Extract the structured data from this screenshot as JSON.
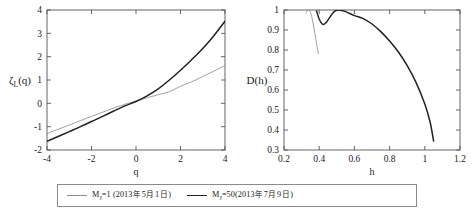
{
  "figure": {
    "title": "",
    "panels": [
      "zeta-q-panel",
      "d-h-panel"
    ]
  },
  "legend": {
    "position": "bottom",
    "entries": [
      {
        "name": "series-mj1",
        "label_prefix": "M",
        "label_sub": "J",
        "label_mid": "=1",
        "date_open": "(2013",
        "date_year_char": "年",
        "date_month": "5",
        "date_month_char": "月",
        "date_day": "1",
        "date_day_char": "日",
        "date_close": ")",
        "color": "#8f8f8f"
      },
      {
        "name": "series-mj50",
        "label_prefix": "M",
        "label_sub": "J",
        "label_mid": "=50",
        "date_open": "(2013",
        "date_year_char": "年",
        "date_month": "7",
        "date_month_char": "月",
        "date_day": "9",
        "date_day_char": "日",
        "date_close": ")",
        "color": "#222222"
      }
    ]
  },
  "chart_data": [
    {
      "type": "line",
      "name": "zeta-q-panel",
      "title": "",
      "xlabel": "q",
      "ylabel_base": "ζ",
      "ylabel_sub": "L",
      "ylabel_rest": "(q)",
      "ylabel": "ζL(q)",
      "xlim": [
        -4,
        4
      ],
      "ylim": [
        -2,
        4
      ],
      "xticks": [
        -4,
        -2,
        0,
        2,
        4
      ],
      "xticklabels": [
        "-4",
        "-2",
        "0",
        "2",
        "4"
      ],
      "yticks": [
        -2,
        -1,
        0,
        1,
        2,
        3,
        4
      ],
      "yticklabels": [
        "-2",
        "-1",
        "0",
        "1",
        "2",
        "3",
        "4"
      ],
      "grid": false,
      "legend_position": "below-figure",
      "series": [
        {
          "name": "M_J=1 (2013-05-01)",
          "color": "#8f8f8f",
          "x": [
            -4,
            -3.5,
            -3,
            -2.5,
            -2,
            -1.5,
            -1,
            -0.5,
            0,
            0.5,
            1,
            1.5,
            2,
            2.5,
            3,
            3.5,
            4
          ],
          "values": [
            -1.3,
            -1.11,
            -0.93,
            -0.74,
            -0.56,
            -0.38,
            -0.2,
            -0.04,
            0.1,
            0.24,
            0.37,
            0.5,
            0.73,
            0.92,
            1.15,
            1.38,
            1.62
          ]
        },
        {
          "name": "M_J=50 (2013-07-09)",
          "color": "#222222",
          "x": [
            -4,
            -3.5,
            -3,
            -2.5,
            -2,
            -1.5,
            -1,
            -0.5,
            0,
            0.5,
            1,
            1.5,
            2,
            2.5,
            3,
            3.5,
            4
          ],
          "values": [
            -1.63,
            -1.42,
            -1.21,
            -1.0,
            -0.78,
            -0.56,
            -0.33,
            -0.11,
            0.08,
            0.32,
            0.62,
            1.0,
            1.42,
            1.87,
            2.35,
            2.9,
            3.52
          ]
        }
      ]
    },
    {
      "type": "line",
      "name": "d-h-panel",
      "title": "",
      "xlabel": "h",
      "ylabel": "D(h)",
      "xlim": [
        0.2,
        1.2
      ],
      "ylim": [
        0.3,
        1.0
      ],
      "xticks": [
        0.2,
        0.4,
        0.6,
        0.8,
        1.0,
        1.2
      ],
      "xticklabels": [
        "0.2",
        "0.4",
        "0.6",
        "0.8",
        "1",
        "1.2"
      ],
      "yticks": [
        0.3,
        0.4,
        0.5,
        0.6,
        0.7,
        0.8,
        0.9,
        1.0
      ],
      "yticklabels": [
        "0.3",
        "0.4",
        "0.5",
        "0.6",
        "0.7",
        "0.8",
        "0.9",
        "1"
      ],
      "grid": false,
      "legend_position": "below-figure",
      "series": [
        {
          "name": "M_J=1 (2013-05-01)",
          "color": "#8f8f8f",
          "x": [
            0.325,
            0.335,
            0.345,
            0.355,
            0.365,
            0.375,
            0.385,
            0.395
          ],
          "values": [
            0.985,
            0.999,
            0.998,
            0.975,
            0.935,
            0.886,
            0.832,
            0.782
          ]
        },
        {
          "name": "M_J=50 (2013-07-09)",
          "color": "#222222",
          "x": [
            0.385,
            0.4,
            0.42,
            0.44,
            0.46,
            0.48,
            0.5,
            0.52,
            0.55,
            0.6,
            0.65,
            0.7,
            0.75,
            0.8,
            0.85,
            0.9,
            0.95,
            1.0,
            1.03,
            1.05
          ],
          "values": [
            0.995,
            0.955,
            0.928,
            0.938,
            0.963,
            0.988,
            0.999,
            0.999,
            0.992,
            0.972,
            0.957,
            0.93,
            0.892,
            0.845,
            0.79,
            0.722,
            0.638,
            0.53,
            0.44,
            0.345
          ]
        }
      ]
    }
  ]
}
